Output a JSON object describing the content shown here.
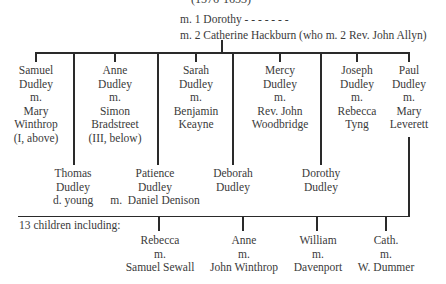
{
  "header": {
    "dates": "(1576-1653)",
    "marriage1": "m. 1 Dorothy - - - - - - -",
    "marriage2": "m. 2 Catherine Hackburn (who m. 2 Rev. John Allyn)"
  },
  "children": [
    {
      "lines": [
        "Samuel",
        "Dudley",
        "m.",
        "Mary",
        "Winthrop",
        "(I, above)"
      ]
    },
    {
      "lines": [
        "Thomas",
        "Dudley",
        "d. young"
      ]
    },
    {
      "lines": [
        "Anne",
        "Dudley",
        "m.",
        "Simon",
        "Bradstreet",
        "(III, below)"
      ]
    },
    {
      "lines": [
        "Patience",
        "Dudley",
        "m.  Daniel Denison"
      ]
    },
    {
      "lines": [
        "Sarah",
        "Dudley",
        "m.",
        "Benjamin",
        "Keayne"
      ]
    },
    {
      "lines": [
        "Deborah",
        "Dudley"
      ]
    },
    {
      "lines": [
        "Mercy",
        "Dudley",
        "m.",
        "Rev. John",
        "Woodbridge"
      ]
    },
    {
      "lines": [
        "Dorothy",
        "Dudley"
      ]
    },
    {
      "lines": [
        "Joseph",
        "Dudley",
        "m.",
        "Rebecca",
        "Tyng"
      ]
    },
    {
      "lines": [
        "Paul",
        "Dudley",
        "m.",
        "Mary",
        "Leverett"
      ]
    }
  ],
  "grandchildren_label": "13 children including:",
  "grandchildren": [
    {
      "lines": [
        "Rebecca",
        "m.",
        "Samuel Sewall"
      ]
    },
    {
      "lines": [
        "Anne",
        "m.",
        "John Winthrop"
      ]
    },
    {
      "lines": [
        "William",
        "m.",
        "Davenport"
      ]
    },
    {
      "lines": [
        "Cath.",
        "m.",
        "W. Dummer"
      ]
    }
  ]
}
